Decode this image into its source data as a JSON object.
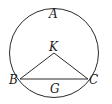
{
  "diagram": {
    "type": "geometry",
    "labels": {
      "A": "A",
      "K": "K",
      "B": "B",
      "C": "C",
      "G": "G"
    },
    "colors": {
      "stroke": "#2a2a2a",
      "background": "#ffffff"
    }
  }
}
